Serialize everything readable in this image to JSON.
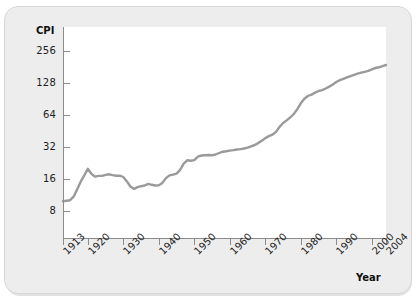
{
  "chart_data": {
    "type": "line",
    "title": "",
    "ylabel": "CPI",
    "xlabel": "Year",
    "yscale": "log",
    "ylim": [
      6.5,
      380
    ],
    "xlim": [
      1913,
      2004
    ],
    "grid": false,
    "legend": false,
    "line_color": "#9a9a9a",
    "y_ticks": [
      "8",
      "16",
      "32",
      "64",
      "128",
      "256"
    ],
    "y_tick_values": [
      8,
      16,
      32,
      64,
      128,
      256
    ],
    "x_ticks": [
      "1913",
      "1920",
      "1930",
      "1940",
      "1950",
      "1960",
      "1970",
      "1980",
      "1990",
      "2000",
      "2004"
    ],
    "x_tick_values": [
      1913,
      1920,
      1930,
      1940,
      1950,
      1960,
      1970,
      1980,
      1990,
      2000,
      2004
    ],
    "series": [
      {
        "name": "CPI",
        "x": [
          1913,
          1914,
          1915,
          1916,
          1917,
          1918,
          1919,
          1920,
          1921,
          1922,
          1923,
          1924,
          1925,
          1926,
          1927,
          1928,
          1929,
          1930,
          1931,
          1932,
          1933,
          1934,
          1935,
          1936,
          1937,
          1938,
          1939,
          1940,
          1941,
          1942,
          1943,
          1944,
          1945,
          1946,
          1947,
          1948,
          1949,
          1950,
          1951,
          1952,
          1953,
          1954,
          1955,
          1956,
          1957,
          1958,
          1959,
          1960,
          1961,
          1962,
          1963,
          1964,
          1965,
          1966,
          1967,
          1968,
          1969,
          1970,
          1971,
          1972,
          1973,
          1974,
          1975,
          1976,
          1977,
          1978,
          1979,
          1980,
          1981,
          1982,
          1983,
          1984,
          1985,
          1986,
          1987,
          1988,
          1989,
          1990,
          1991,
          1992,
          1993,
          1994,
          1995,
          1996,
          1997,
          1998,
          1999,
          2000,
          2001,
          2002,
          2003,
          2004
        ],
        "values": [
          9.9,
          10.0,
          10.1,
          10.9,
          12.8,
          15.1,
          17.3,
          20.0,
          17.9,
          16.8,
          17.1,
          17.1,
          17.5,
          17.7,
          17.4,
          17.2,
          17.2,
          16.7,
          15.2,
          13.6,
          12.9,
          13.4,
          13.7,
          13.9,
          14.4,
          14.1,
          13.9,
          14.0,
          14.7,
          16.3,
          17.3,
          17.6,
          18.0,
          19.5,
          22.3,
          24.0,
          23.8,
          24.1,
          26.0,
          26.6,
          26.8,
          26.9,
          26.8,
          27.2,
          28.1,
          28.9,
          29.2,
          29.6,
          29.9,
          30.3,
          30.6,
          31.0,
          31.5,
          32.5,
          33.4,
          34.8,
          36.7,
          38.8,
          40.5,
          41.8,
          44.4,
          49.3,
          53.8,
          56.9,
          60.6,
          65.2,
          72.6,
          82.4,
          90.9,
          96.5,
          99.6,
          103.9,
          107.6,
          109.6,
          113.6,
          118.3,
          124.0,
          130.7,
          136.2,
          140.3,
          144.5,
          148.2,
          152.4,
          156.9,
          160.5,
          163.0,
          166.6,
          172.2,
          177.1,
          179.9,
          184.0,
          188.9
        ]
      }
    ]
  }
}
